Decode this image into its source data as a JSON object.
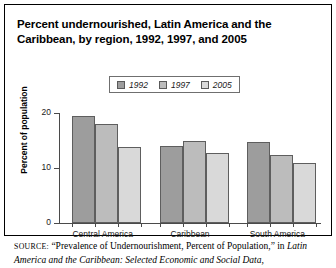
{
  "title": "Percent undernourished, Latin America and the Caribbean, by region, 1992, 1997, and 2005",
  "axis": {
    "ylabel": "Percent of population",
    "yticks": [
      "0",
      "10",
      "20"
    ]
  },
  "legend": {
    "items": [
      {
        "label": "1992",
        "color": "#9d9d9d",
        "icon": "legend-swatch-icon"
      },
      {
        "label": "1997",
        "color": "#bcbcbc",
        "icon": "legend-swatch-icon"
      },
      {
        "label": "2005",
        "color": "#d9d9d9",
        "icon": "legend-swatch-icon"
      }
    ]
  },
  "source": {
    "prefix": "SOURCE:",
    "text": " “Prevalence of Undernourishment, Percent of Population,” in ",
    "italic": "Latin America and the Caribbean: Selected Economic and Social Data,"
  },
  "chart_data": {
    "type": "bar",
    "title": "Percent undernourished, Latin America and the Caribbean, by region, 1992, 1997, and 2005",
    "xlabel": "",
    "ylabel": "Percent of population",
    "ylim": [
      0,
      20
    ],
    "yticks": [
      0,
      10,
      20
    ],
    "grid": false,
    "legend_position": "top-center",
    "categories": [
      "Central America",
      "Caribbean",
      "South America"
    ],
    "series": [
      {
        "name": "1992",
        "color": "#9d9d9d",
        "values": [
          19.5,
          14.0,
          14.8
        ]
      },
      {
        "name": "1997",
        "color": "#bcbcbc",
        "values": [
          18.0,
          15.0,
          12.3
        ]
      },
      {
        "name": "2005",
        "color": "#d9d9d9",
        "values": [
          13.8,
          12.8,
          11.0
        ]
      }
    ]
  }
}
